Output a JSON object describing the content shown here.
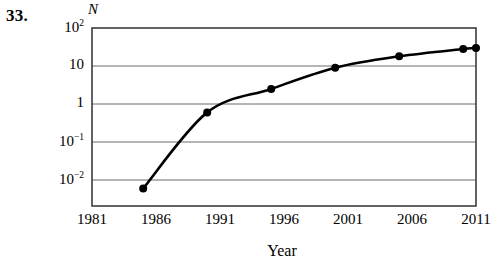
{
  "problem": {
    "number": "33."
  },
  "axes": {
    "y_title": "N",
    "x_title": "Year",
    "y_ticks": [
      {
        "base": "10",
        "exp": "2",
        "value": 100
      },
      {
        "base": "10",
        "exp": "",
        "value": 10
      },
      {
        "base": "1",
        "exp": "",
        "value": 1
      },
      {
        "base": "10",
        "exp": "−1",
        "value": 0.1
      },
      {
        "base": "10",
        "exp": "−2",
        "value": 0.01
      }
    ],
    "x_ticks": [
      "1981",
      "1986",
      "1991",
      "1996",
      "2001",
      "2006",
      "2011"
    ]
  },
  "chart_data": {
    "type": "line",
    "title": "",
    "xlabel": "Year",
    "ylabel": "N",
    "yscale": "log",
    "xlim": [
      1981,
      2011
    ],
    "ylim": [
      0.003,
      100
    ],
    "grid": "horizontal",
    "legend": "none",
    "series": [
      {
        "name": "N",
        "marker": "filled-circle",
        "color": "#000000",
        "points": [
          {
            "x": 1985,
            "y": 0.006
          },
          {
            "x": 1990,
            "y": 0.6
          },
          {
            "x": 1995,
            "y": 2.5
          },
          {
            "x": 2000,
            "y": 9
          },
          {
            "x": 2005,
            "y": 18
          },
          {
            "x": 2010,
            "y": 28
          },
          {
            "x": 2011,
            "y": 30
          }
        ]
      }
    ]
  },
  "colors": {
    "ink": "#000000",
    "gridline": "#6b6b6b",
    "frame": "#3c3c3c",
    "background": "#ffffff"
  }
}
